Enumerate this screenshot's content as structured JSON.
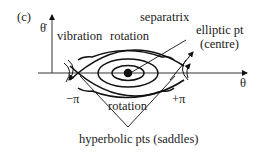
{
  "figure": {
    "panel_label": "(c)",
    "y_axis_label": "θ̇",
    "x_axis_label": "θ",
    "labels": {
      "vibration": "vibration",
      "rotation_top": "rotation",
      "rotation_bottom": "rotation",
      "separatrix": "separatrix",
      "elliptic_pt": "elliptic pt",
      "centre": "(centre)",
      "minus_pi": "−π",
      "plus_pi": "+π",
      "hyperbolic": "hyperbolic pts (saddles)"
    },
    "colors": {
      "line": "#111111",
      "background": "#ffffff"
    }
  }
}
